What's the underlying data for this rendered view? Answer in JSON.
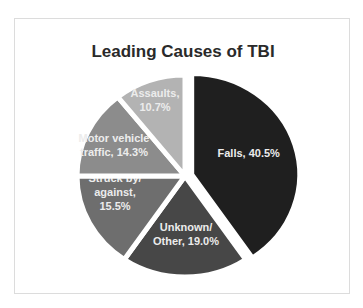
{
  "chart_data": {
    "type": "pie",
    "title": "Leading Causes of TBI",
    "categories": [
      "Falls",
      "Unknown/Other",
      "Struck by/against",
      "Motor vehicle traffic",
      "Assaults"
    ],
    "values": [
      40.5,
      19.0,
      15.5,
      14.3,
      10.7
    ],
    "unit": "%",
    "colors": [
      "#1f1f1f",
      "#474747",
      "#6e6e6e",
      "#8c8c8c",
      "#b3b3b3"
    ],
    "start_angle_deg": 0,
    "direction": "clockwise",
    "exploded": [
      "Falls"
    ],
    "legend": "none",
    "data_labels": [
      [
        "Falls, 40.5%"
      ],
      [
        "Unknown/",
        "Other, 19.0%"
      ],
      [
        "Struck by/",
        "against,",
        "15.5%"
      ],
      [
        "Motor vehicle",
        "traffic, 14.3%"
      ],
      [
        "Assaults,",
        "10.7%"
      ]
    ]
  }
}
